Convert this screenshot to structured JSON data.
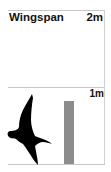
{
  "card": {
    "title": "Wingspan",
    "scale_max_label": "2m",
    "scale_mid_label": "1m"
  },
  "bar": {
    "value_m": 1.1,
    "color": "#8c8c8c"
  },
  "icon": {
    "name": "flying-bird-silhouette",
    "color": "#000000"
  }
}
